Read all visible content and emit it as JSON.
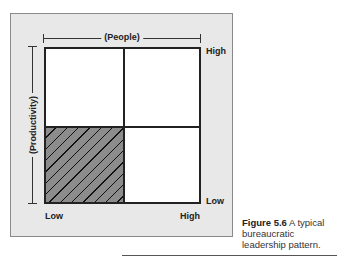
{
  "figure": {
    "x_axis_label": "(People)",
    "y_axis_label": "(Productivity)",
    "x_low": "Low",
    "x_high": "High",
    "y_high": "High",
    "y_low": "Low",
    "highlighted_quadrant": "bottom-left",
    "colors": {
      "panel_bg": "#e8e8e8",
      "hatch_fill": "#8c8c8c",
      "grid_line": "#222222"
    }
  },
  "caption": {
    "number": "Figure 5.6",
    "text_line1": " A typical",
    "text_line2": "bureaucratic",
    "text_line3": "leadership pattern."
  }
}
